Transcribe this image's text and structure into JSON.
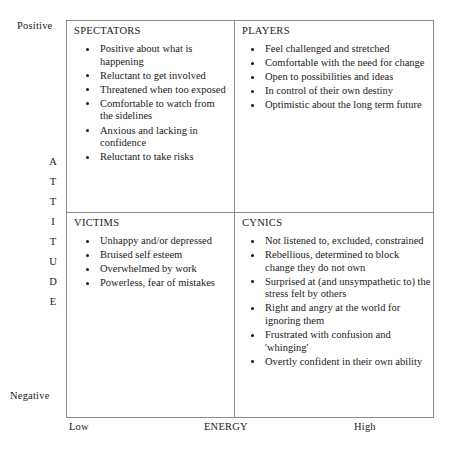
{
  "axes": {
    "vertical": {
      "name": "ATTITUDE",
      "letters": [
        "A",
        "T",
        "T",
        "I",
        "T",
        "U",
        "D",
        "E"
      ],
      "high_label": "Positive",
      "low_label": "Negative"
    },
    "horizontal": {
      "name": "ENERGY",
      "low_label": "Low",
      "high_label": "High"
    }
  },
  "quadrants": {
    "spectators": {
      "title": "SPECTATORS",
      "items": [
        "Positive about what is happening",
        "Reluctant to get involved",
        "Threatened when too exposed",
        "Comfortable to watch from the sidelines",
        "Anxious and lacking in confidence",
        "Reluctant to take risks"
      ]
    },
    "players": {
      "title": "PLAYERS",
      "items": [
        "Feel challenged and stretched",
        "Comfortable with the need for change",
        "Open to possibilities and ideas",
        "In control of their own destiny",
        "Optimistic about the long term future"
      ]
    },
    "victims": {
      "title": "VICTIMS",
      "items": [
        "Unhappy and/or depressed",
        "Bruised self esteem",
        "Overwhelmed by work",
        "Powerless, fear of mistakes"
      ]
    },
    "cynics": {
      "title": "CYNICS",
      "items": [
        "Not listened to, excluded, constrained",
        "Rebellious, determined to block change they do not own",
        "Surprised at (and unsympathetic to) the stress felt by others",
        "Right and angry at the world for ignoring them",
        "Frustrated with confusion and 'whinging'",
        "Overtly confident in their own ability"
      ]
    }
  },
  "colors": {
    "border": "#8c8c8c",
    "text": "#1a1a1a",
    "background": "#ffffff"
  }
}
